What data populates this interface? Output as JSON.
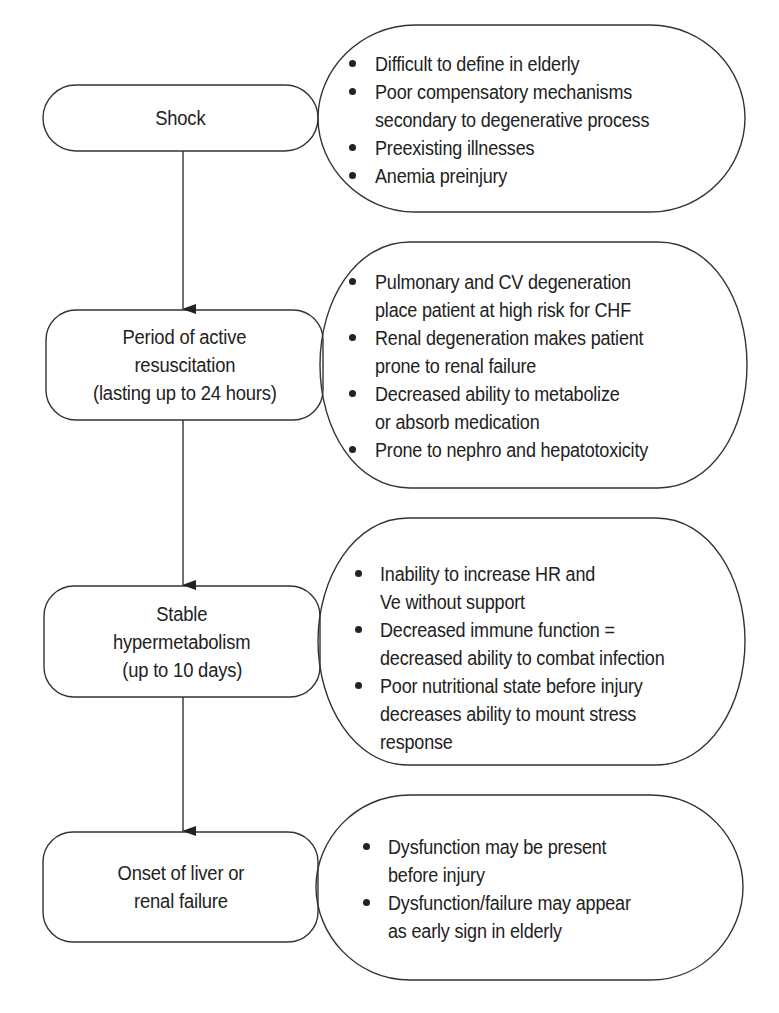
{
  "colors": {
    "stroke": "#333333",
    "text": "#222222",
    "background": "#ffffff"
  },
  "stages": [
    {
      "id": "shock",
      "lines": [
        "Shock"
      ]
    },
    {
      "id": "active-resuscitation",
      "lines": [
        "Period of active",
        "resuscitation",
        "(lasting up to 24 hours)"
      ]
    },
    {
      "id": "stable-hypermetabolism",
      "lines": [
        "Stable",
        "hypermetabolism",
        "(up to 10 days)"
      ]
    },
    {
      "id": "organ-failure",
      "lines": [
        "Onset of liver or",
        "renal failure"
      ]
    }
  ],
  "notes": [
    {
      "bullets": [
        {
          "lines": [
            "Difficult to define in elderly"
          ]
        },
        {
          "lines": [
            "Poor compensatory mechanisms",
            "secondary to degenerative process"
          ]
        },
        {
          "lines": [
            "Preexisting illnesses"
          ]
        },
        {
          "lines": [
            "Anemia preinjury"
          ]
        }
      ]
    },
    {
      "bullets": [
        {
          "lines": [
            "Pulmonary and CV degeneration",
            "place patient at high risk for CHF"
          ]
        },
        {
          "lines": [
            "Renal degeneration makes patient",
            "prone to renal failure"
          ]
        },
        {
          "lines": [
            "Decreased ability to metabolize",
            "or absorb medication"
          ]
        },
        {
          "lines": [
            "Prone to nephro and hepatotoxicity"
          ]
        }
      ]
    },
    {
      "bullets": [
        {
          "lines": [
            "Inability to increase HR and",
            "Ve without support"
          ]
        },
        {
          "lines": [
            "Decreased immune function =",
            "decreased ability to combat infection"
          ]
        },
        {
          "lines": [
            "Poor nutritional state before injury",
            "decreases ability to mount stress",
            "response"
          ]
        }
      ]
    },
    {
      "bullets": [
        {
          "lines": [
            "Dysfunction may be present",
            "before injury"
          ]
        },
        {
          "lines": [
            "Dysfunction/failure may appear",
            "as early sign in elderly"
          ]
        }
      ]
    }
  ]
}
